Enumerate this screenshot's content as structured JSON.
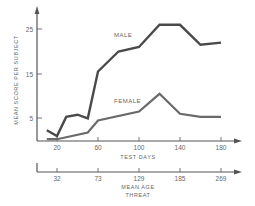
{
  "chart_data": {
    "type": "line",
    "title": "",
    "xlabel": "TEST DAYS",
    "ylabel": "MEAN SCORE PER SUBJECT",
    "secondary_xlabel": [
      "MEAN AGE",
      "THREAT"
    ],
    "x_ticks": [
      20,
      60,
      100,
      140,
      180
    ],
    "secondary_x_ticks": [
      32,
      73,
      129,
      185,
      269
    ],
    "y_ticks": [
      5,
      15,
      25
    ],
    "xlim": [
      10,
      190
    ],
    "ylim": [
      0,
      30
    ],
    "grid": false,
    "series": [
      {
        "name": "MALE",
        "color": "#4a4a4a",
        "x": [
          10,
          20,
          29,
          40,
          50,
          60,
          80,
          100,
          120,
          140,
          160,
          180
        ],
        "values": [
          2.3,
          1.0,
          5.3,
          5.8,
          5.0,
          15.5,
          20.0,
          21.0,
          26.0,
          26.0,
          21.5,
          22.0
        ]
      },
      {
        "name": "FEMALE",
        "color": "#666666",
        "x": [
          10,
          20,
          50,
          60,
          100,
          120,
          140,
          160,
          180
        ],
        "values": [
          0.3,
          0.3,
          1.8,
          4.5,
          6.5,
          10.5,
          6.0,
          5.3,
          5.3
        ]
      }
    ],
    "annotations": [
      {
        "text": "MALE",
        "x": 90,
        "y": 23
      },
      {
        "text": "FEMALE",
        "x": 87,
        "y": 8
      }
    ]
  },
  "labels": {
    "y_axis": "MEAN SCORE PER SUBJECT",
    "x_axis": "TEST DAYS",
    "secondary_axis_line1": "MEAN AGE",
    "secondary_axis_line2": "THREAT",
    "male": "MALE",
    "female": "FEMALE",
    "y_tick_25": "25",
    "y_tick_15": "15",
    "y_tick_5": "5",
    "x_tick_20": "20",
    "x_tick_60": "60",
    "x_tick_100": "100",
    "x_tick_140": "140",
    "x_tick_180": "180",
    "age_tick_32": "32",
    "age_tick_73": "73",
    "age_tick_129": "129",
    "age_tick_185": "185",
    "age_tick_269": "269"
  }
}
